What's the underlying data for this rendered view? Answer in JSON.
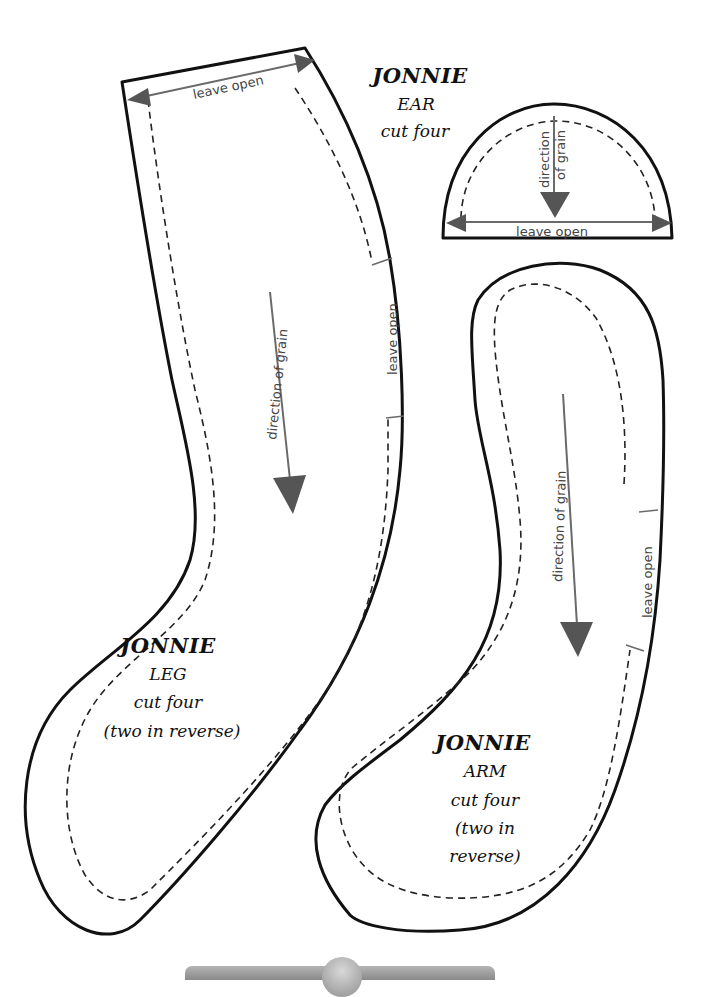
{
  "document": {
    "title": "Jonnie sewing pattern pieces",
    "colors": {
      "outline": "#111111",
      "arrow": "#555555",
      "background": "#ffffff"
    }
  },
  "pieces": {
    "ear": {
      "name": "JONNIE",
      "part": "EAR",
      "instruction": "cut four",
      "grain_label_1": "direction",
      "grain_label_2": "of grain",
      "open_label": "leave open"
    },
    "leg": {
      "name": "JONNIE",
      "part": "LEG",
      "instruction": "cut four",
      "note": "(two in reverse)",
      "top_open_label": "leave open",
      "side_open_label": "leave open",
      "grain_label": "direction of grain"
    },
    "arm": {
      "name": "JONNIE",
      "part": "ARM",
      "instruction": "cut four",
      "note_1": "(two in",
      "note_2": "reverse)",
      "side_open_label": "leave open",
      "grain_label": "direction of grain"
    }
  }
}
